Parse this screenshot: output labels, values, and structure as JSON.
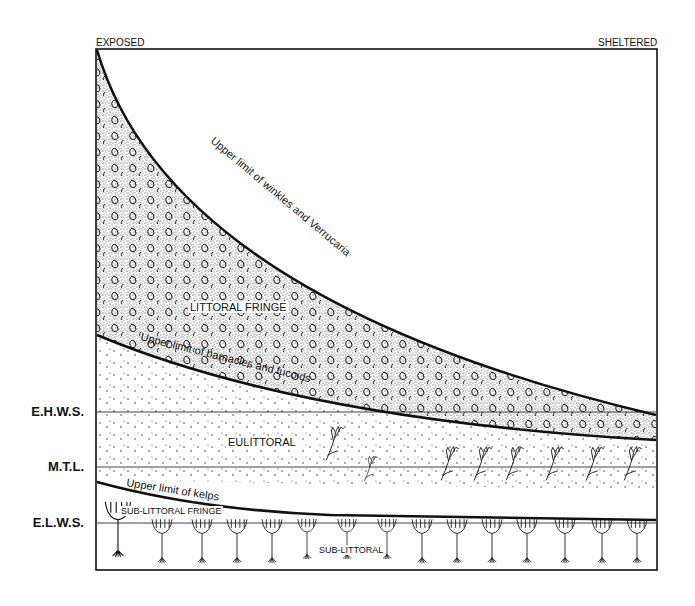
{
  "diagram": {
    "top_labels": {
      "left": "EXPOSED",
      "right": "SHELTERED"
    },
    "levels": [
      {
        "label": "E.H.W.S.",
        "y": 412
      },
      {
        "label": "M.T.L.",
        "y": 467
      },
      {
        "label": "E.L.W.S.",
        "y": 523
      }
    ],
    "zones": {
      "littoral_fringe": "LITTORAL FRINGE",
      "eulittoral": "EULITTORAL",
      "sub_littoral_fringe": "SUB-LITTORAL FRINGE",
      "sub_littoral": "SUB-LITTORAL"
    },
    "boundaries": {
      "winkles": "Upper limit of winkles and Verrucaria",
      "barnacles": "Upper limit of barnacles and fucoids",
      "kelps": "Upper limit of kelps"
    },
    "colors": {
      "ink": "#111111",
      "background": "#ffffff"
    }
  }
}
